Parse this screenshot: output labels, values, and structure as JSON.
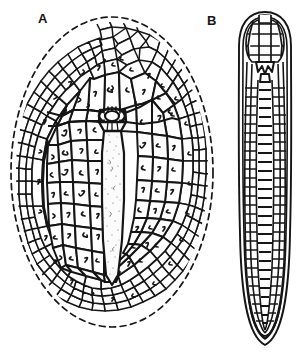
{
  "figure_plate": {
    "background_color": "#ffffff",
    "ink_color": "#151515",
    "width": 307,
    "height": 353,
    "panels": [
      {
        "label": "A",
        "label_x": 38,
        "label_y": 12,
        "view": "dorsal-view-oval-plated-body",
        "outline_style": "dashed-oval-margin",
        "center_x": 112,
        "center_y": 172,
        "radius_x": 103,
        "radius_y": 157,
        "description": "oval specimen covered in polygonal plates with a central dark ring and an elongate stippled median plate"
      },
      {
        "label": "B",
        "label_x": 207,
        "label_y": 14,
        "view": "lateral-view-elongate-striated-body",
        "outline_style": "solid-double-contour",
        "center_x": 265,
        "center_y": 178,
        "width": 52,
        "height": 332,
        "description": "elongate club-shaped specimen with rounded capped anterior, longitudinal bands and transverse striations"
      }
    ]
  },
  "labels": {
    "panel_a": "A",
    "panel_b": "B"
  },
  "caption": {
    "text": ""
  }
}
